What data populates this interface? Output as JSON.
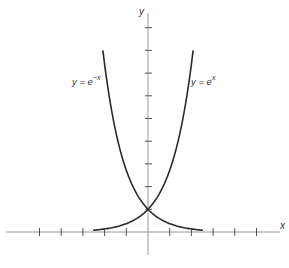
{
  "chart_data": {
    "type": "line",
    "title": "",
    "xlabel": "x",
    "ylabel": "y",
    "xlim": [
      -6.5,
      6.2
    ],
    "ylim": [
      -1,
      9.6
    ],
    "x_ticks": [
      -5,
      -4,
      -3,
      -2,
      -1,
      1,
      2,
      3,
      4,
      5
    ],
    "y_ticks": [
      1,
      2,
      3,
      4,
      5,
      6,
      7,
      8,
      9
    ],
    "tick_labels_shown": false,
    "grid": false,
    "legend": null,
    "series": [
      {
        "name": "y = e^x",
        "label_main": "y = e",
        "label_sup": "x",
        "x": [
          -2.53,
          -2,
          -1.5,
          -1,
          -0.5,
          0,
          0.5,
          1,
          1.5,
          1.8,
          2.08
        ],
        "values": [
          0.08,
          0.135,
          0.223,
          0.368,
          0.607,
          1,
          1.649,
          2.718,
          4.482,
          6.05,
          8.0
        ]
      },
      {
        "name": "y = e^-x",
        "label_main": "y = e",
        "label_sup": "−x",
        "x": [
          -2.08,
          -1.8,
          -1.5,
          -1,
          -0.5,
          0,
          0.5,
          1,
          1.5,
          2,
          2.53
        ],
        "values": [
          8.0,
          6.05,
          4.482,
          2.718,
          1.649,
          1,
          0.607,
          0.368,
          0.223,
          0.135,
          0.08
        ]
      }
    ],
    "annotations": [
      {
        "text": "y = e^−x",
        "near": "left curve, upper"
      },
      {
        "text": "y = e^x",
        "near": "right curve, upper"
      },
      {
        "text": "intersection",
        "point": [
          0,
          1
        ]
      }
    ],
    "colors": {
      "axis": "#999999",
      "curve": "#2a2a2a",
      "text": "#333333"
    }
  }
}
